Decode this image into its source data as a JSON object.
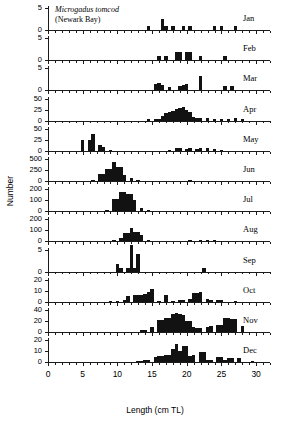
{
  "figure": {
    "annotation_species": "Microgadus tomcod",
    "annotation_location": "(Newark Bay)",
    "caption_fragment": "length-frequency distributions of"
  },
  "chart_data": {
    "type": "bar",
    "title": "Microgadus tomcod (Newark Bay)",
    "xlabel": "Length (cm TL)",
    "ylabel": "Number",
    "xlim": [
      0,
      32
    ],
    "xticks": [
      0,
      5,
      10,
      15,
      20,
      25,
      30
    ],
    "xtick_labels": [
      "0",
      "5",
      "10",
      "15",
      "20",
      "25",
      "30"
    ],
    "bin_width": 0.5,
    "grid": false,
    "legend": "none",
    "panel_layout": "12 stacked panels, one per month, shared x-axis",
    "panels": [
      {
        "label": "Jan",
        "ylim": [
          0,
          5
        ],
        "yticks": [
          0,
          5
        ],
        "ytick_labels": [
          "0",
          "5"
        ],
        "x": [
          14.5,
          16.5,
          17.0,
          18.0,
          19.5,
          20.5,
          24.0,
          25.0,
          27.0
        ],
        "values": [
          1,
          2.4,
          1,
          1,
          1,
          1,
          1,
          1,
          1
        ]
      },
      {
        "label": "Feb",
        "ylim": [
          0,
          5
        ],
        "yticks": [
          0,
          5
        ],
        "ytick_labels": [
          "0",
          "5"
        ],
        "x": [
          16.0,
          17.0,
          18.5,
          19.0,
          20.0,
          20.5,
          22.0,
          25.5
        ],
        "values": [
          1,
          1,
          1.8,
          1.8,
          1.8,
          1.8,
          1,
          1
        ]
      },
      {
        "label": "Mar",
        "ylim": [
          0,
          5
        ],
        "yticks": [
          0,
          5
        ],
        "ytick_labels": [
          "0",
          "5"
        ],
        "x": [
          15.5,
          16.0,
          16.5,
          17.5,
          19.0,
          19.5,
          20.0,
          22.0,
          25.5,
          26.5
        ],
        "values": [
          1.5,
          1.6,
          1.3,
          0.7,
          1,
          1.3,
          1.5,
          3.3,
          1,
          1
        ]
      },
      {
        "label": "Apr",
        "ylim": [
          0,
          50
        ],
        "yticks": [
          0,
          25,
          50
        ],
        "ytick_labels": [
          "0",
          "25",
          "50"
        ],
        "x": [
          14.5,
          15.5,
          16.0,
          16.5,
          17.0,
          17.5,
          18.0,
          18.5,
          19.0,
          19.5,
          20.0,
          20.5,
          21.0,
          21.5,
          22.0,
          23.0,
          24.0,
          25.0,
          26.0,
          27.0,
          28.0
        ],
        "values": [
          1,
          2,
          4,
          10,
          17,
          20,
          21,
          27,
          28,
          30,
          23,
          20,
          8,
          7,
          7,
          7,
          2,
          4,
          3,
          5,
          2
        ]
      },
      {
        "label": "May",
        "ylim": [
          0,
          50
        ],
        "yticks": [
          0,
          25,
          50
        ],
        "ytick_labels": [
          "0",
          "25",
          "50"
        ],
        "x": [
          5.0,
          6.0,
          6.5,
          7.5,
          8.0,
          9.0,
          17.5,
          18.5,
          19.0,
          20.0,
          20.5,
          21.5,
          22.0,
          23.0,
          24.0,
          25.0
        ],
        "values": [
          24,
          24,
          39,
          13,
          9,
          2,
          2,
          6,
          6,
          4,
          6,
          5,
          6,
          7,
          3,
          2
        ]
      },
      {
        "label": "Jun",
        "ylim": [
          0,
          500
        ],
        "yticks": [
          0,
          250,
          500
        ],
        "ytick_labels": [
          "0",
          "250",
          "500"
        ],
        "x": [
          6.5,
          7.5,
          8.0,
          8.5,
          9.0,
          9.5,
          10.0,
          10.5,
          11.0,
          12.0,
          13.0,
          20.5
        ],
        "values": [
          18,
          150,
          150,
          270,
          270,
          430,
          320,
          320,
          140,
          60,
          10,
          8
        ]
      },
      {
        "label": "Jul",
        "ylim": [
          0,
          200
        ],
        "yticks": [
          0,
          100,
          200
        ],
        "ytick_labels": [
          "0",
          "100",
          "200"
        ],
        "x": [
          8.5,
          9.5,
          10.0,
          10.5,
          11.0,
          11.5,
          12.0,
          12.5,
          13.5,
          14.5
        ],
        "values": [
          15,
          110,
          110,
          175,
          175,
          155,
          155,
          105,
          30,
          8
        ]
      },
      {
        "label": "Aug",
        "ylim": [
          0,
          200
        ],
        "yticks": [
          0,
          100,
          200
        ],
        "ytick_labels": [
          "0",
          "100",
          "200"
        ],
        "x": [
          9.5,
          10.5,
          11.0,
          11.5,
          12.0,
          12.5,
          13.0,
          13.5,
          14.5,
          20.5,
          22.0,
          23.0,
          24.0
        ],
        "values": [
          12,
          30,
          75,
          75,
          118,
          90,
          90,
          60,
          12,
          2,
          2,
          2,
          3
        ]
      },
      {
        "label": "Sep",
        "ylim": [
          0,
          5
        ],
        "yticks": [
          0,
          5
        ],
        "ytick_labels": [
          "0",
          "5"
        ],
        "x": [
          10.0,
          10.5,
          11.5,
          12.0,
          12.5,
          13.0,
          22.5
        ],
        "values": [
          1.8,
          0.8,
          0.8,
          6,
          0.8,
          4,
          0.8
        ]
      },
      {
        "label": "Oct",
        "ylim": [
          0,
          20
        ],
        "yticks": [
          0,
          10,
          20
        ],
        "ytick_labels": [
          "0",
          "10",
          "20"
        ],
        "x": [
          9.0,
          10.0,
          11.0,
          11.5,
          12.5,
          13.0,
          13.5,
          14.0,
          14.5,
          15.0,
          16.0,
          17.0,
          18.0,
          19.0,
          19.5,
          20.5,
          21.0,
          21.5,
          22.0,
          23.0,
          23.5,
          24.5,
          25.0,
          27.0
        ],
        "values": [
          0.6,
          0.6,
          2,
          5,
          6,
          6,
          6,
          7,
          9,
          12,
          0.6,
          6,
          0.6,
          2,
          2,
          3,
          8,
          8,
          9,
          3,
          2,
          2,
          2,
          1
        ]
      },
      {
        "label": "Nov",
        "ylim": [
          0,
          40
        ],
        "yticks": [
          0,
          20,
          40
        ],
        "ytick_labels": [
          "0",
          "20",
          "40"
        ],
        "x": [
          13.5,
          14.0,
          15.0,
          16.0,
          16.5,
          17.0,
          17.5,
          18.0,
          18.5,
          19.0,
          19.5,
          20.0,
          20.5,
          21.0,
          21.5,
          22.0,
          23.0,
          23.5,
          24.5,
          25.0,
          25.5,
          26.0,
          26.5,
          27.0,
          28.0
        ],
        "values": [
          3,
          4,
          9,
          21,
          21,
          26,
          25,
          32,
          34,
          32,
          31,
          20,
          20,
          9,
          7,
          7,
          9,
          11,
          13,
          13,
          26,
          26,
          23,
          23,
          11
        ]
      },
      {
        "label": "Dec",
        "ylim": [
          0,
          20
        ],
        "yticks": [
          0,
          10,
          20
        ],
        "ytick_labels": [
          "0",
          "10",
          "20"
        ],
        "x": [
          13.0,
          13.5,
          14.0,
          14.5,
          15.5,
          16.0,
          16.5,
          17.0,
          17.5,
          18.0,
          18.5,
          19.0,
          19.5,
          20.0,
          20.5,
          21.0,
          22.0,
          22.5,
          23.0,
          23.5,
          24.5,
          25.0,
          25.5,
          26.0,
          26.5,
          27.5,
          29.5
        ],
        "values": [
          1,
          1.5,
          2,
          2,
          5,
          6,
          6,
          7,
          7,
          12,
          17,
          10,
          15,
          15,
          6,
          7,
          9,
          9,
          2,
          2,
          5,
          5,
          2,
          4,
          4,
          4,
          1
        ]
      }
    ]
  }
}
